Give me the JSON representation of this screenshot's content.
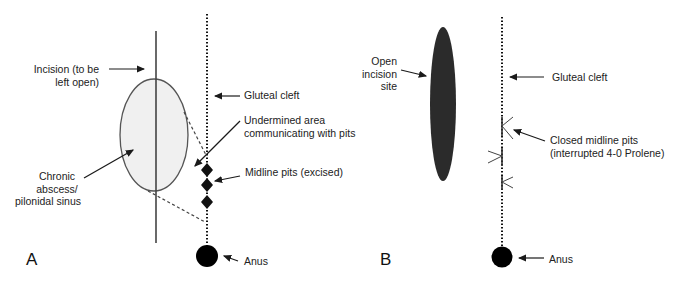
{
  "panels": [
    {
      "letter": "A",
      "labels": {
        "incision": [
          "Incision (to be",
          "left open)"
        ],
        "gluteal_cleft": "Gluteal cleft",
        "undermined": [
          "Undermined area",
          "communicating with pits"
        ],
        "midline_pits": "Midline pits (excised)",
        "abscess": [
          "Chronic",
          "abscess/",
          "pilonidal sinus"
        ],
        "anus": "Anus"
      }
    },
    {
      "letter": "B",
      "labels": {
        "open_incision": [
          "Open",
          "incision",
          "site"
        ],
        "gluteal_cleft": "Gluteal cleft",
        "closed_pits": [
          "Closed midline pits",
          "(interrupted 4-0 Prolene)"
        ],
        "anus": "Anus"
      }
    }
  ],
  "colors": {
    "ink": "#1a1a1a",
    "abscess_fill": "#f0f0f0",
    "incision_fill": "#2b2b2b"
  }
}
